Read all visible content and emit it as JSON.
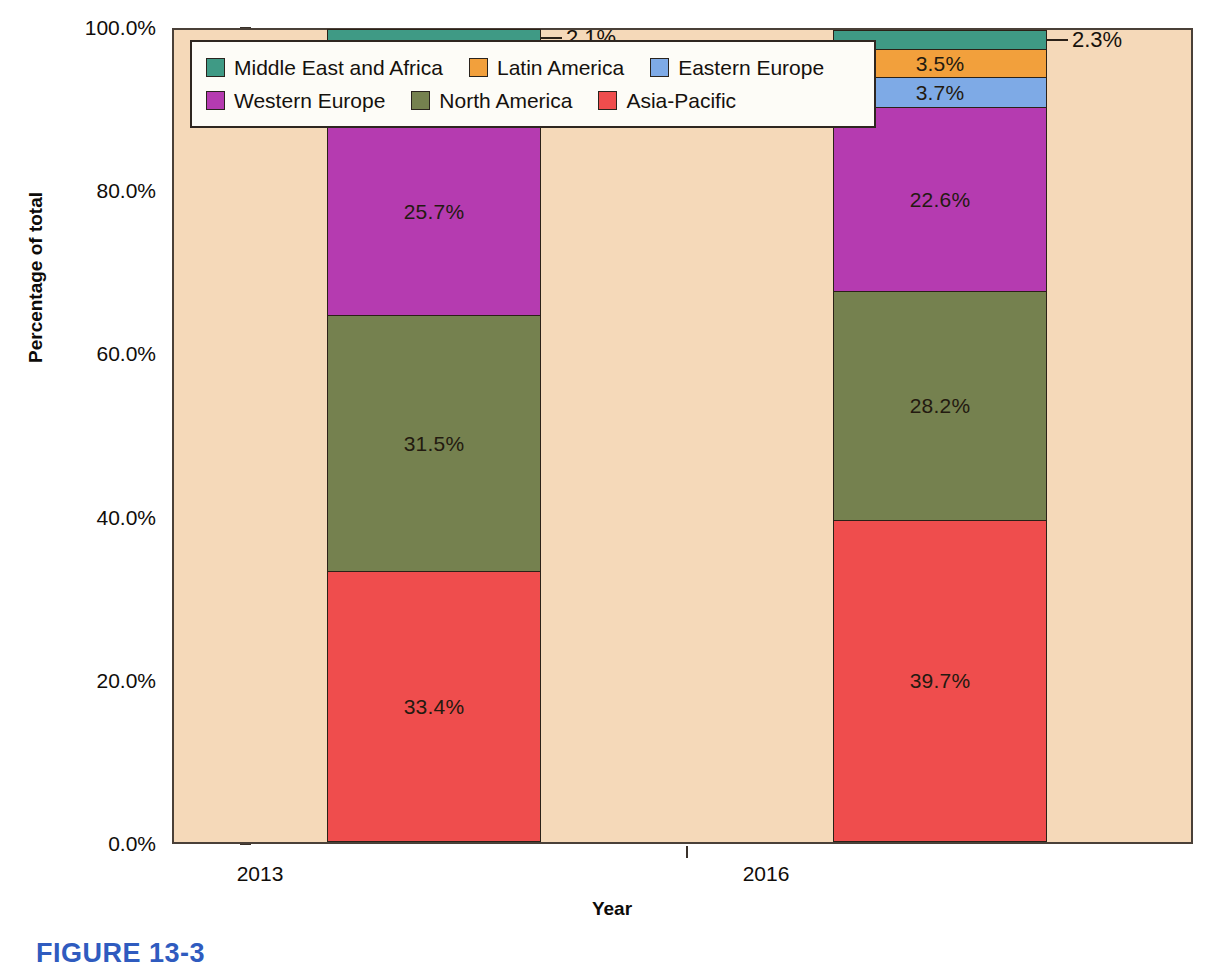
{
  "chart_data": {
    "type": "bar",
    "subtype": "stacked-100-percent",
    "title": "",
    "xlabel": "Year",
    "ylabel": "Percentage of total",
    "categories": [
      "2013",
      "2016"
    ],
    "ylim": [
      0,
      100
    ],
    "ytick_labels": [
      "0.0%",
      "20.0%",
      "40.0%",
      "60.0%",
      "80.0%",
      "100.0%"
    ],
    "ytick_values": [
      0,
      20,
      40,
      60,
      80,
      100
    ],
    "grid": false,
    "legend_position": "top-left-inside",
    "stack_order_bottom_to_top": [
      "Asia-Pacific",
      "North America",
      "Western Europe",
      "Eastern Europe",
      "Latin America",
      "Middle East and Africa"
    ],
    "series": [
      {
        "name": "Middle East and Africa",
        "color": "#3f9a85",
        "values": [
          2.1,
          2.3
        ],
        "labels": [
          "2.1%",
          "2.3%"
        ],
        "label_style": "callout"
      },
      {
        "name": "Latin America",
        "color": "#f2a03c",
        "values": [
          3.5,
          3.5
        ],
        "labels": [
          "3.5%",
          "3.5%"
        ],
        "label_style": "inside"
      },
      {
        "name": "Eastern Europe",
        "color": "#7eaae6",
        "values": [
          3.9,
          3.7
        ],
        "labels": [
          "3.9%",
          "3.7%"
        ],
        "label_style": "inside"
      },
      {
        "name": "Western Europe",
        "color": "#b53bb0",
        "values": [
          25.7,
          22.6
        ],
        "labels": [
          "25.7%",
          "22.6%"
        ],
        "label_style": "inside"
      },
      {
        "name": "North America",
        "color": "#75814f",
        "values": [
          31.5,
          28.2
        ],
        "labels": [
          "31.5%",
          "28.2%"
        ],
        "label_style": "inside"
      },
      {
        "name": "Asia-Pacific",
        "color": "#ef4d4d",
        "values": [
          33.4,
          39.7
        ],
        "labels": [
          "33.4%",
          "39.7%"
        ],
        "label_style": "inside"
      }
    ]
  },
  "legend": {
    "rows": [
      [
        {
          "label": "Middle East and Africa",
          "color": "#3f9a85"
        },
        {
          "label": "Latin America",
          "color": "#f2a03c"
        },
        {
          "label": "Eastern Europe",
          "color": "#7eaae6"
        }
      ],
      [
        {
          "label": "Western Europe",
          "color": "#b53bb0"
        },
        {
          "label": "North America",
          "color": "#75814f"
        },
        {
          "label": "Asia-Pacific",
          "color": "#ef4d4d"
        }
      ]
    ]
  },
  "axes": {
    "y_title": "Percentage of total",
    "x_title": "Year",
    "y_ticks": [
      "100.0%",
      "80.0%",
      "60.0%",
      "40.0%",
      "20.0%",
      "0.0%"
    ],
    "x_ticks": [
      "2013",
      "2016"
    ]
  },
  "bars": [
    {
      "category": "2013",
      "segments": [
        {
          "series": "Middle East and Africa",
          "value": 2.1,
          "label": "2.1%",
          "color": "#3f9a85",
          "label_style": "callout"
        },
        {
          "series": "Latin America",
          "value": 3.5,
          "label": "3.5%",
          "color": "#f2a03c",
          "label_style": "inside"
        },
        {
          "series": "Eastern Europe",
          "value": 3.9,
          "label": "3.9%",
          "color": "#7eaae6",
          "label_style": "inside"
        },
        {
          "series": "Western Europe",
          "value": 25.7,
          "label": "25.7%",
          "color": "#b53bb0",
          "label_style": "inside"
        },
        {
          "series": "North America",
          "value": 31.5,
          "label": "31.5%",
          "color": "#75814f",
          "label_style": "inside"
        },
        {
          "series": "Asia-Pacific",
          "value": 33.4,
          "label": "33.4%",
          "color": "#ef4d4d",
          "label_style": "inside"
        }
      ]
    },
    {
      "category": "2016",
      "segments": [
        {
          "series": "Middle East and Africa",
          "value": 2.3,
          "label": "2.3%",
          "color": "#3f9a85",
          "label_style": "callout"
        },
        {
          "series": "Latin America",
          "value": 3.5,
          "label": "3.5%",
          "color": "#f2a03c",
          "label_style": "inside"
        },
        {
          "series": "Eastern Europe",
          "value": 3.7,
          "label": "3.7%",
          "color": "#7eaae6",
          "label_style": "inside"
        },
        {
          "series": "Western Europe",
          "value": 22.6,
          "label": "22.6%",
          "color": "#b53bb0",
          "label_style": "inside"
        },
        {
          "series": "North America",
          "value": 28.2,
          "label": "28.2%",
          "color": "#75814f",
          "label_style": "inside"
        },
        {
          "series": "Asia-Pacific",
          "value": 39.7,
          "label": "39.7%",
          "color": "#ef4d4d",
          "label_style": "inside"
        }
      ]
    }
  ],
  "caption": {
    "text": "FIGURE 13-3"
  },
  "colors": {
    "plot_background": "#f5d9b9",
    "page_background": "#ffffff",
    "axis_line": "#4a4038",
    "caption": "#2f5bbf"
  }
}
